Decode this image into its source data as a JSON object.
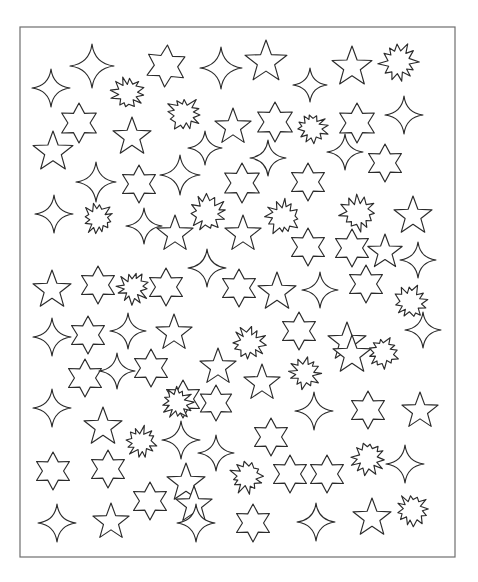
{
  "document": {
    "title": "Star Shapes Scatter Sheet",
    "background_color": "#ffffff",
    "frame": {
      "x": 20,
      "y": 27,
      "width": 435,
      "height": 530,
      "stroke_color": "#6e6e6e",
      "stroke_width": 1.2,
      "fill": "#ffffff"
    },
    "shape_style": {
      "fill": "#ffffff",
      "stroke_color": "#2b2b2b",
      "stroke_width": 1.15
    }
  },
  "legend": {
    "shape_types": [
      {
        "key": "sparkle4",
        "label": "Four-pointed sparkle",
        "points": 4,
        "count": 33
      },
      {
        "key": "star5",
        "label": "Five-pointed star",
        "points": 5,
        "count": 29
      },
      {
        "key": "star6",
        "label": "Six-pointed star",
        "points": 6,
        "count": 32
      },
      {
        "key": "burst",
        "label": "Starburst",
        "points": 12,
        "count": 20
      }
    ],
    "total_shapes": 114
  },
  "shapes": [
    {
      "type": "sparkle4",
      "x": 51,
      "y": 88,
      "r": 19,
      "rot": 0
    },
    {
      "type": "sparkle4",
      "x": 92,
      "y": 66,
      "r": 22,
      "rot": 0
    },
    {
      "type": "burst",
      "x": 128,
      "y": 93,
      "r": 17,
      "rot": 8
    },
    {
      "type": "star6",
      "x": 166,
      "y": 66,
      "r": 21,
      "rot": 4
    },
    {
      "type": "sparkle4",
      "x": 221,
      "y": 68,
      "r": 21,
      "rot": 0
    },
    {
      "type": "star5",
      "x": 266,
      "y": 62,
      "r": 22,
      "rot": 0
    },
    {
      "type": "sparkle4",
      "x": 310,
      "y": 85,
      "r": 17,
      "rot": 0
    },
    {
      "type": "star5",
      "x": 352,
      "y": 67,
      "r": 21,
      "rot": 0
    },
    {
      "type": "burst",
      "x": 399,
      "y": 62,
      "r": 20,
      "rot": -5
    },
    {
      "type": "star6",
      "x": 79,
      "y": 123,
      "r": 20,
      "rot": 0
    },
    {
      "type": "burst",
      "x": 184,
      "y": 114,
      "r": 18,
      "rot": 5
    },
    {
      "type": "star5",
      "x": 132,
      "y": 137,
      "r": 20,
      "rot": 0
    },
    {
      "type": "star5",
      "x": 233,
      "y": 127,
      "r": 19,
      "rot": 0
    },
    {
      "type": "star6",
      "x": 275,
      "y": 122,
      "r": 20,
      "rot": 0
    },
    {
      "type": "burst",
      "x": 312,
      "y": 128,
      "r": 16,
      "rot": -8
    },
    {
      "type": "star6",
      "x": 357,
      "y": 123,
      "r": 20,
      "rot": 0
    },
    {
      "type": "sparkle4",
      "x": 404,
      "y": 115,
      "r": 19,
      "rot": 0
    },
    {
      "type": "star5",
      "x": 53,
      "y": 152,
      "r": 21,
      "rot": 0
    },
    {
      "type": "sparkle4",
      "x": 96,
      "y": 182,
      "r": 20,
      "rot": 0
    },
    {
      "type": "star6",
      "x": 139,
      "y": 184,
      "r": 19,
      "rot": 0
    },
    {
      "type": "sparkle4",
      "x": 180,
      "y": 175,
      "r": 20,
      "rot": 0
    },
    {
      "type": "sparkle4",
      "x": 205,
      "y": 148,
      "r": 17,
      "rot": 0
    },
    {
      "type": "star6",
      "x": 242,
      "y": 183,
      "r": 20,
      "rot": 0
    },
    {
      "type": "sparkle4",
      "x": 268,
      "y": 158,
      "r": 18,
      "rot": 0
    },
    {
      "type": "star6",
      "x": 308,
      "y": 182,
      "r": 19,
      "rot": 0
    },
    {
      "type": "sparkle4",
      "x": 345,
      "y": 152,
      "r": 18,
      "rot": 0
    },
    {
      "type": "star6",
      "x": 385,
      "y": 163,
      "r": 19,
      "rot": 0
    },
    {
      "type": "sparkle4",
      "x": 54,
      "y": 214,
      "r": 19,
      "rot": 0
    },
    {
      "type": "burst",
      "x": 98,
      "y": 219,
      "r": 16,
      "rot": 10
    },
    {
      "type": "burst",
      "x": 208,
      "y": 213,
      "r": 19,
      "rot": -6
    },
    {
      "type": "sparkle4",
      "x": 144,
      "y": 226,
      "r": 18,
      "rot": 0
    },
    {
      "type": "star5",
      "x": 175,
      "y": 234,
      "r": 19,
      "rot": 0
    },
    {
      "type": "star5",
      "x": 243,
      "y": 234,
      "r": 19,
      "rot": 0
    },
    {
      "type": "burst",
      "x": 283,
      "y": 217,
      "r": 18,
      "rot": 6
    },
    {
      "type": "star6",
      "x": 308,
      "y": 247,
      "r": 19,
      "rot": 0
    },
    {
      "type": "burst",
      "x": 358,
      "y": 213,
      "r": 18,
      "rot": -4
    },
    {
      "type": "star5",
      "x": 413,
      "y": 216,
      "r": 20,
      "rot": 0
    },
    {
      "type": "star6",
      "x": 352,
      "y": 248,
      "r": 19,
      "rot": 0
    },
    {
      "type": "star5",
      "x": 385,
      "y": 252,
      "r": 18,
      "rot": 0
    },
    {
      "type": "sparkle4",
      "x": 418,
      "y": 260,
      "r": 18,
      "rot": 0
    },
    {
      "type": "star5",
      "x": 52,
      "y": 290,
      "r": 20,
      "rot": 0
    },
    {
      "type": "star6",
      "x": 98,
      "y": 285,
      "r": 19,
      "rot": 0
    },
    {
      "type": "burst",
      "x": 133,
      "y": 288,
      "r": 16,
      "rot": 8
    },
    {
      "type": "star6",
      "x": 166,
      "y": 287,
      "r": 19,
      "rot": 0
    },
    {
      "type": "sparkle4",
      "x": 207,
      "y": 268,
      "r": 19,
      "rot": 0
    },
    {
      "type": "star6",
      "x": 239,
      "y": 288,
      "r": 19,
      "rot": 0
    },
    {
      "type": "star5",
      "x": 277,
      "y": 292,
      "r": 20,
      "rot": 0
    },
    {
      "type": "sparkle4",
      "x": 320,
      "y": 290,
      "r": 18,
      "rot": 0
    },
    {
      "type": "star6",
      "x": 366,
      "y": 284,
      "r": 19,
      "rot": 0
    },
    {
      "type": "burst",
      "x": 411,
      "y": 302,
      "r": 18,
      "rot": -7
    },
    {
      "type": "sparkle4",
      "x": 52,
      "y": 337,
      "r": 19,
      "rot": 0
    },
    {
      "type": "star6",
      "x": 88,
      "y": 335,
      "r": 19,
      "rot": 0
    },
    {
      "type": "sparkle4",
      "x": 128,
      "y": 331,
      "r": 18,
      "rot": 0
    },
    {
      "type": "star5",
      "x": 174,
      "y": 333,
      "r": 19,
      "rot": 0
    },
    {
      "type": "burst",
      "x": 249,
      "y": 343,
      "r": 17,
      "rot": 5
    },
    {
      "type": "star6",
      "x": 299,
      "y": 331,
      "r": 19,
      "rot": 0
    },
    {
      "type": "star5",
      "x": 347,
      "y": 342,
      "r": 20,
      "rot": 0
    },
    {
      "type": "burst",
      "x": 383,
      "y": 353,
      "r": 16,
      "rot": -9
    },
    {
      "type": "sparkle4",
      "x": 423,
      "y": 330,
      "r": 18,
      "rot": 0
    },
    {
      "type": "star6",
      "x": 85,
      "y": 378,
      "r": 19,
      "rot": 0
    },
    {
      "type": "sparkle4",
      "x": 117,
      "y": 371,
      "r": 18,
      "rot": 0
    },
    {
      "type": "star6",
      "x": 151,
      "y": 368,
      "r": 19,
      "rot": 0
    },
    {
      "type": "star5",
      "x": 218,
      "y": 367,
      "r": 19,
      "rot": 0
    },
    {
      "type": "star5",
      "x": 262,
      "y": 383,
      "r": 19,
      "rot": 0
    },
    {
      "type": "burst",
      "x": 305,
      "y": 373,
      "r": 16,
      "rot": 6
    },
    {
      "type": "star5",
      "x": 352,
      "y": 355,
      "r": 20,
      "rot": 0
    },
    {
      "type": "star6",
      "x": 183,
      "y": 399,
      "r": 19,
      "rot": 0
    },
    {
      "type": "sparkle4",
      "x": 52,
      "y": 408,
      "r": 19,
      "rot": 0
    },
    {
      "type": "burst",
      "x": 177,
      "y": 403,
      "r": 16,
      "rot": -5
    },
    {
      "type": "star6",
      "x": 216,
      "y": 403,
      "r": 18,
      "rot": 0
    },
    {
      "type": "sparkle4",
      "x": 314,
      "y": 411,
      "r": 19,
      "rot": 0
    },
    {
      "type": "star6",
      "x": 368,
      "y": 410,
      "r": 19,
      "rot": 0
    },
    {
      "type": "star5",
      "x": 420,
      "y": 411,
      "r": 19,
      "rot": 0
    },
    {
      "type": "star5",
      "x": 103,
      "y": 427,
      "r": 20,
      "rot": 0
    },
    {
      "type": "burst",
      "x": 141,
      "y": 442,
      "r": 16,
      "rot": 9
    },
    {
      "type": "sparkle4",
      "x": 181,
      "y": 440,
      "r": 19,
      "rot": 0
    },
    {
      "type": "sparkle4",
      "x": 216,
      "y": 453,
      "r": 18,
      "rot": 0
    },
    {
      "type": "star6",
      "x": 271,
      "y": 437,
      "r": 19,
      "rot": 0
    },
    {
      "type": "star6",
      "x": 53,
      "y": 471,
      "r": 19,
      "rot": 0
    },
    {
      "type": "star6",
      "x": 108,
      "y": 469,
      "r": 19,
      "rot": 0
    },
    {
      "type": "star5",
      "x": 186,
      "y": 483,
      "r": 20,
      "rot": 0
    },
    {
      "type": "burst",
      "x": 247,
      "y": 477,
      "r": 17,
      "rot": -6
    },
    {
      "type": "star6",
      "x": 290,
      "y": 474,
      "r": 19,
      "rot": 0
    },
    {
      "type": "star6",
      "x": 327,
      "y": 474,
      "r": 19,
      "rot": 0
    },
    {
      "type": "burst",
      "x": 368,
      "y": 458,
      "r": 17,
      "rot": 7
    },
    {
      "type": "sparkle4",
      "x": 405,
      "y": 464,
      "r": 19,
      "rot": 0
    },
    {
      "type": "star6",
      "x": 150,
      "y": 501,
      "r": 19,
      "rot": 0
    },
    {
      "type": "star5",
      "x": 194,
      "y": 505,
      "r": 19,
      "rot": 0
    },
    {
      "type": "burst",
      "x": 412,
      "y": 510,
      "r": 17,
      "rot": -8
    },
    {
      "type": "sparkle4",
      "x": 57,
      "y": 523,
      "r": 19,
      "rot": 0
    },
    {
      "type": "star5",
      "x": 111,
      "y": 522,
      "r": 19,
      "rot": 0
    },
    {
      "type": "sparkle4",
      "x": 196,
      "y": 523,
      "r": 19,
      "rot": 0
    },
    {
      "type": "star6",
      "x": 253,
      "y": 523,
      "r": 19,
      "rot": 0
    },
    {
      "type": "sparkle4",
      "x": 316,
      "y": 522,
      "r": 19,
      "rot": 0
    },
    {
      "type": "star5",
      "x": 372,
      "y": 518,
      "r": 20,
      "rot": 0
    },
    {
      "type": "star5",
      "x": 88,
      "y": 172,
      "r": 0,
      "rot": 0
    },
    {
      "type": "sparkle4",
      "x": 142,
      "y": 298,
      "r": 0,
      "rot": 0
    }
  ]
}
